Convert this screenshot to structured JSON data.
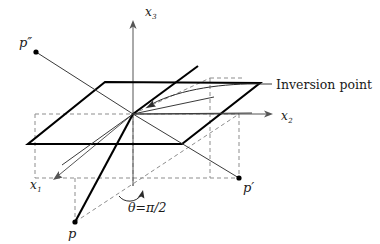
{
  "figure": {
    "background_color": "#ffffff",
    "line_color": "#000000",
    "dashed_color": "#8d8d8d",
    "axis_color": "#555555"
  },
  "axes": [
    {
      "id": "x3",
      "label": "x",
      "subscript": "3",
      "label_x": 145,
      "label_y": 16
    },
    {
      "id": "x2",
      "label": "x",
      "subscript": "2",
      "label_x": 281,
      "label_y": 120
    },
    {
      "id": "x1",
      "label": "x",
      "subscript": "1",
      "label_x": 30,
      "label_y": 189
    }
  ],
  "points": [
    {
      "id": "p-double-prime",
      "label": "p″",
      "dot_x": 36,
      "dot_y": 52,
      "label_x": 19,
      "label_y": 47
    },
    {
      "id": "p-prime",
      "label": "p′",
      "dot_x": 239,
      "dot_y": 178,
      "label_x": 243,
      "label_y": 192
    },
    {
      "id": "p",
      "label": "p",
      "dot_x": 75,
      "dot_y": 222,
      "label_x": 68,
      "label_y": 238
    }
  ],
  "annotations": [
    {
      "id": "inversion-point",
      "text": "Inversion point",
      "x": 268,
      "y": 89
    },
    {
      "id": "theta-angle",
      "text": "θ=π/2",
      "x": 128,
      "y": 210
    }
  ],
  "origin": {
    "x": 133,
    "y": 114
  }
}
